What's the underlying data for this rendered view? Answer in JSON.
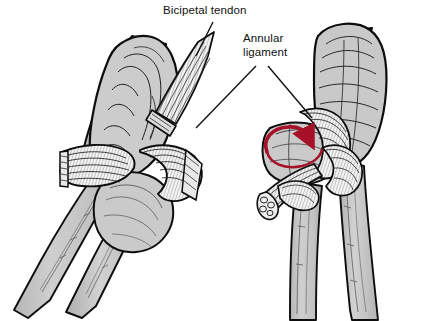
{
  "figure": {
    "kind": "anatomical-line-drawing",
    "width": 433,
    "height": 321,
    "background_color": "#ffffff",
    "panels": [
      {
        "id": "left-panel",
        "name": "supinated-view",
        "description": "Distal humerus with proximal radius and ulna, bicipital tendon inserting on radial tuberosity, annular ligament encircling the radial head"
      },
      {
        "id": "right-panel",
        "name": "pronated-view",
        "description": "Same elbow rotated into pronation, radius crossing over ulna, cut bicipital tendon stump shown in cross-section"
      }
    ]
  },
  "labels": [
    {
      "id": "bicipital-tendon",
      "text": "Bicipetal tendon",
      "lines": [
        "Bicipetal tendon"
      ],
      "x": 163,
      "y": 14,
      "anchor": "start",
      "leader": "single"
    },
    {
      "id": "annular-ligament",
      "text": "Annular ligament",
      "lines": [
        "Annular",
        "ligament"
      ],
      "x": 243,
      "y": 42,
      "anchor": "start",
      "leader": "double"
    }
  ],
  "annotations": [
    {
      "id": "rotation-arrow",
      "name": "red-rotation-arrow",
      "meaning": "direction of radial head rotation (pronation)",
      "color": "#a61127"
    }
  ],
  "colors": {
    "bone_fill": "#c6c6c6",
    "bone_fill_light": "#d8d8d8",
    "bone_fill_dark": "#aeaeae",
    "outline": "#0d0d0d",
    "tendon_fill": "#f2f2f2",
    "hatch": "#1a1a1a",
    "label_text": "#101010",
    "leader_line": "#111111",
    "arrow_red": "#a61127",
    "background": "#ffffff"
  }
}
